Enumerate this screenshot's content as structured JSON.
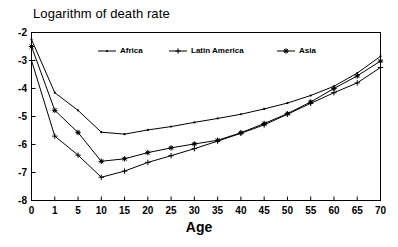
{
  "chart_data": {
    "type": "line",
    "title": "Logarithm of death rate",
    "xlabel": "Age",
    "ylabel": "",
    "categories": [
      "0",
      "1",
      "5",
      "10",
      "15",
      "20",
      "25",
      "30",
      "35",
      "40",
      "45",
      "50",
      "55",
      "60",
      "65",
      "70"
    ],
    "x": [
      0,
      1,
      5,
      10,
      15,
      20,
      25,
      30,
      35,
      40,
      45,
      50,
      55,
      60,
      65,
      70
    ],
    "xtick_labels": [
      "0",
      "1",
      "5",
      "10",
      "15",
      "20",
      "25",
      "30",
      "35",
      "40",
      "45",
      "50",
      "55",
      "60",
      "65",
      "70"
    ],
    "ytick_labels": [
      "-2",
      "-3",
      "-4",
      "-5",
      "-6",
      "-7",
      "-8"
    ],
    "yticks": [
      -2,
      -3,
      -4,
      -5,
      -6,
      -7,
      -8
    ],
    "ylim": [
      -8,
      -2
    ],
    "xlim_category_spacing": "even",
    "grid": false,
    "legend_position": "top-center-inside",
    "series": [
      {
        "name": "Africa",
        "marker": "dot",
        "color": "#000000",
        "values": [
          -2.25,
          -4.15,
          -4.78,
          -5.56,
          -5.63,
          -5.48,
          -5.36,
          -5.21,
          -5.07,
          -4.92,
          -4.73,
          -4.52,
          -4.25,
          -3.92,
          -3.45,
          -2.85
        ]
      },
      {
        "name": "Latin America",
        "marker": "plus",
        "color": "#000000",
        "values": [
          -3.0,
          -5.7,
          -6.38,
          -7.17,
          -6.95,
          -6.64,
          -6.4,
          -6.15,
          -5.88,
          -5.6,
          -5.3,
          -4.92,
          -4.53,
          -4.15,
          -3.8,
          -3.25
        ]
      },
      {
        "name": "Asia",
        "marker": "asterisk",
        "color": "#000000",
        "values": [
          -2.5,
          -4.78,
          -5.57,
          -6.6,
          -6.51,
          -6.29,
          -6.12,
          -5.98,
          -5.85,
          -5.58,
          -5.25,
          -4.9,
          -4.48,
          -4.0,
          -3.55,
          -3.02
        ]
      }
    ]
  },
  "legend": {
    "items": [
      {
        "label": "Africa",
        "marker": "dot"
      },
      {
        "label": "Latin America",
        "marker": "plus"
      },
      {
        "label": "Asia",
        "marker": "asterisk"
      }
    ]
  }
}
